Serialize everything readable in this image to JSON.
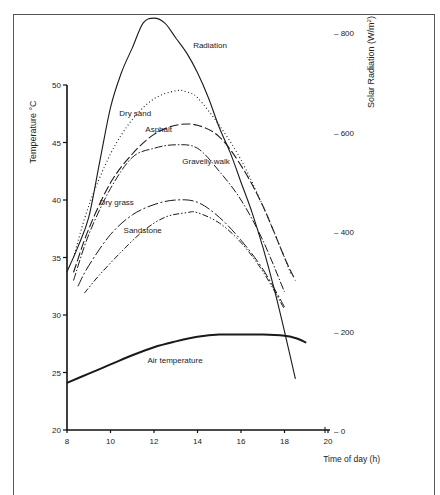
{
  "chart_data": {
    "type": "line",
    "title": "",
    "xlabel": "Time of day (h)",
    "ylabel": "Temperature °C",
    "y2label": "Solar Radiation (W/m²)",
    "xlim": [
      8,
      20
    ],
    "ylim": [
      20,
      50
    ],
    "y2lim": [
      0,
      800
    ],
    "xticks": [
      8,
      10,
      12,
      14,
      16,
      18,
      20
    ],
    "yticks": [
      20,
      25,
      30,
      35,
      40,
      45,
      50
    ],
    "y2ticks": [
      0,
      200,
      400,
      600,
      800
    ],
    "grid": false,
    "legend": "inline labels",
    "series": [
      {
        "name": "Radiation",
        "axis": "y2",
        "style": "solid",
        "x": [
          8.0,
          8.5,
          9.0,
          9.5,
          10.0,
          10.5,
          11.0,
          11.5,
          12.0,
          12.5,
          13.0,
          13.5,
          14.0,
          14.5,
          15.0,
          15.5,
          16.0,
          16.5,
          17.0,
          17.5,
          18.0,
          18.5
        ],
        "y": [
          320,
          370,
          430,
          540,
          650,
          720,
          770,
          820,
          830,
          820,
          790,
          760,
          720,
          670,
          610,
          560,
          500,
          440,
          370,
          290,
          200,
          105
        ]
      },
      {
        "name": "Dry sand",
        "axis": "y",
        "style": "dotted",
        "x": [
          8.3,
          9.0,
          10.0,
          11.0,
          12.0,
          13.0,
          13.5,
          14.0,
          15.0,
          16.0,
          17.0,
          18.0,
          18.3
        ],
        "y": [
          35.0,
          39.5,
          44.0,
          47.0,
          48.8,
          49.5,
          49.4,
          48.9,
          46.5,
          43.5,
          39.5,
          35.0,
          33.5
        ]
      },
      {
        "name": "Asphalt",
        "axis": "y",
        "style": "long-dash",
        "x": [
          8.3,
          9.0,
          10.0,
          11.0,
          12.0,
          13.0,
          14.0,
          15.0,
          16.0,
          17.0,
          18.0,
          18.5
        ],
        "y": [
          33.7,
          37.5,
          41.5,
          44.0,
          45.7,
          46.5,
          46.5,
          45.5,
          43.0,
          39.5,
          35.0,
          33.0
        ]
      },
      {
        "name": "Gravelly walk",
        "axis": "y",
        "style": "dash-dot",
        "x": [
          8.3,
          9.0,
          10.0,
          11.0,
          12.0,
          13.0,
          14.0,
          15.0,
          16.0,
          17.0,
          18.0
        ],
        "y": [
          33.0,
          37.0,
          41.0,
          43.7,
          44.5,
          44.8,
          44.5,
          42.5,
          40.0,
          36.5,
          32.0
        ]
      },
      {
        "name": "Dry grass",
        "axis": "y",
        "style": "long-dash-dot",
        "x": [
          8.5,
          9.0,
          10.0,
          11.0,
          12.0,
          13.0,
          14.0,
          15.0,
          16.0,
          17.0,
          18.0
        ],
        "y": [
          32.5,
          34.3,
          37.0,
          38.7,
          39.6,
          40.0,
          39.8,
          38.5,
          36.5,
          34.0,
          30.7
        ]
      },
      {
        "name": "Sandstone",
        "axis": "y",
        "style": "dash-dot-dot",
        "x": [
          8.8,
          9.5,
          10.5,
          11.5,
          12.5,
          13.5,
          14.0,
          15.0,
          16.0,
          17.0,
          18.0
        ],
        "y": [
          31.9,
          33.5,
          35.5,
          37.3,
          38.5,
          38.9,
          38.9,
          38.0,
          36.3,
          33.8,
          30.5
        ]
      },
      {
        "name": "Air temperature",
        "axis": "y",
        "style": "solid-thick",
        "x": [
          8.0,
          9.0,
          10.0,
          11.0,
          12.0,
          13.0,
          14.0,
          15.0,
          16.0,
          17.0,
          18.0,
          18.5,
          19.0
        ],
        "y": [
          24.1,
          24.9,
          25.7,
          26.5,
          27.2,
          27.7,
          28.1,
          28.3,
          28.3,
          28.3,
          28.2,
          28.0,
          27.6
        ]
      }
    ],
    "labels": [
      {
        "text": "Radiation",
        "x": 13.8,
        "y2": 770
      },
      {
        "text": "Dry sand",
        "x": 10.4,
        "y": 47.3
      },
      {
        "text": "Asphalt",
        "x": 11.6,
        "y": 45.9
      },
      {
        "text": "Gravelly walk",
        "x": 13.3,
        "y": 43.1
      },
      {
        "text": "Dry grass",
        "x": 9.5,
        "y": 39.6
      },
      {
        "text": "Sandstone",
        "x": 10.6,
        "y": 37.1
      },
      {
        "text": "Air temperature",
        "x": 11.7,
        "y": 25.8
      }
    ]
  }
}
